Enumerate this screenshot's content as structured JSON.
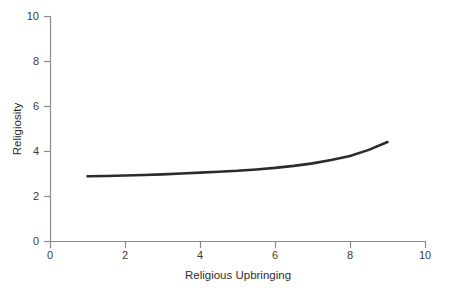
{
  "chart_data": {
    "type": "line",
    "title": "",
    "subtitle": "",
    "xlabel": "Religious Upbringing",
    "ylabel": "Religiosity",
    "xlim": [
      0,
      10
    ],
    "ylim": [
      0,
      10
    ],
    "xticks": [
      0,
      2,
      4,
      6,
      8,
      10
    ],
    "yticks": [
      0,
      2,
      4,
      6,
      8,
      10
    ],
    "xtick_labels": [
      "0",
      "2",
      "4",
      "6",
      "8",
      "10"
    ],
    "ytick_labels": [
      "0",
      "2",
      "4",
      "6",
      "8",
      "10"
    ],
    "grid": false,
    "legend": false,
    "legend_position": "none",
    "annotations": [],
    "line_color": "#2b2b2b",
    "axis_color": "#8a8a8a",
    "background_color": "#ffffff",
    "series": [
      {
        "name": "Religiosity vs Religious Upbringing",
        "color": "#2b2b2b",
        "x": [
          1.0,
          1.5,
          2.0,
          2.5,
          3.0,
          3.5,
          4.0,
          4.5,
          5.0,
          5.5,
          6.0,
          6.5,
          7.0,
          7.5,
          8.0,
          8.5,
          9.0
        ],
        "y": [
          2.88,
          2.89,
          2.91,
          2.93,
          2.96,
          3.0,
          3.04,
          3.08,
          3.12,
          3.18,
          3.25,
          3.34,
          3.45,
          3.6,
          3.78,
          4.05,
          4.4
        ]
      }
    ]
  }
}
